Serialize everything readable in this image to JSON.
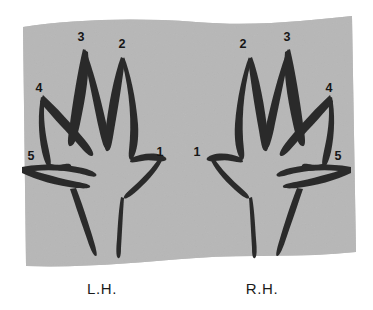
{
  "figure": {
    "background_color": "#ffffff",
    "paper_color": "#b7b7b7",
    "ink_color": "#2b2b2b",
    "label_color": "#161616"
  },
  "captions": {
    "left_hand": "L.H.",
    "right_hand": "R.H."
  },
  "left_hand": {
    "name": "left-hand",
    "finger_labels": [
      {
        "id": "lh-1",
        "text": "1",
        "x": 160,
        "y": 156,
        "finger": "thumb"
      },
      {
        "id": "lh-2",
        "text": "2",
        "x": 122,
        "y": 48,
        "finger": "index"
      },
      {
        "id": "lh-3",
        "text": "3",
        "x": 81,
        "y": 41,
        "finger": "middle"
      },
      {
        "id": "lh-4",
        "text": "4",
        "x": 39,
        "y": 92,
        "finger": "ring"
      },
      {
        "id": "lh-5",
        "text": "5",
        "x": 31,
        "y": 160,
        "finger": "little"
      }
    ]
  },
  "right_hand": {
    "name": "right-hand",
    "finger_labels": [
      {
        "id": "rh-1",
        "text": "1",
        "x": 197,
        "y": 156,
        "finger": "thumb"
      },
      {
        "id": "rh-2",
        "text": "2",
        "x": 243,
        "y": 48,
        "finger": "index"
      },
      {
        "id": "rh-3",
        "text": "3",
        "x": 287,
        "y": 41,
        "finger": "middle"
      },
      {
        "id": "rh-4",
        "text": "4",
        "x": 329,
        "y": 92,
        "finger": "ring"
      },
      {
        "id": "rh-5",
        "text": "5",
        "x": 338,
        "y": 160,
        "finger": "little"
      }
    ]
  }
}
